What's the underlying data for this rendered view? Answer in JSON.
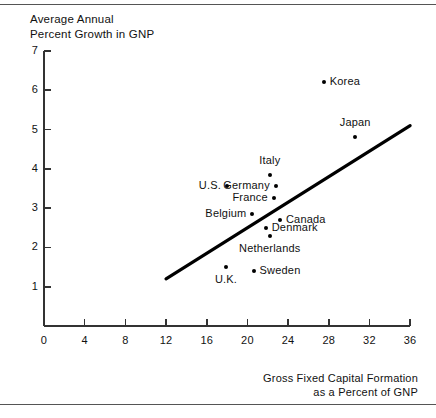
{
  "chart_data": {
    "type": "scatter",
    "title": "Average Annual\nPercent Growth in GNP",
    "ylabel": "Average Annual Percent Growth in GNP",
    "xlabel": "Gross Fixed Capital Formation\nas a Percent of GNP",
    "xlim": [
      0,
      36
    ],
    "ylim": [
      0,
      7
    ],
    "xticks": [
      0,
      4,
      8,
      12,
      16,
      20,
      24,
      28,
      32,
      36
    ],
    "yticks": [
      1,
      2,
      3,
      4,
      5,
      6,
      7
    ],
    "xtick_labels": [
      "0",
      "4",
      "8",
      "12",
      "16",
      "20",
      "24",
      "28",
      "32",
      "36"
    ],
    "ytick_labels": [
      "1",
      "2",
      "3",
      "4",
      "5",
      "6",
      "7"
    ],
    "grid": false,
    "legend": false,
    "points": [
      {
        "label": "Korea",
        "x": 27.5,
        "y": 6.2,
        "label_pos": "right"
      },
      {
        "label": "Japan",
        "x": 30.6,
        "y": 4.8,
        "label_pos": "above"
      },
      {
        "label": "Italy",
        "x": 22.2,
        "y": 3.85,
        "label_pos": "above"
      },
      {
        "label": "U.S.",
        "x": 18.0,
        "y": 3.55,
        "label_pos": "left"
      },
      {
        "label": "Germany",
        "x": 22.8,
        "y": 3.55,
        "label_pos": "left"
      },
      {
        "label": "France",
        "x": 22.6,
        "y": 3.25,
        "label_pos": "left"
      },
      {
        "label": "Belgium",
        "x": 20.5,
        "y": 2.85,
        "label_pos": "left"
      },
      {
        "label": "Canada",
        "x": 23.2,
        "y": 2.7,
        "label_pos": "right"
      },
      {
        "label": "Denmark",
        "x": 21.8,
        "y": 2.5,
        "label_pos": "right"
      },
      {
        "label": "Netherlands",
        "x": 22.2,
        "y": 2.3,
        "label_pos": "above"
      },
      {
        "label": "U.K.",
        "x": 17.9,
        "y": 1.5,
        "label_pos": "above"
      },
      {
        "label": "Sweden",
        "x": 20.6,
        "y": 1.4,
        "label_pos": "right"
      }
    ],
    "trend_line": {
      "x0": 12.0,
      "y0": 1.2,
      "x1": 36.0,
      "y1": 5.1
    },
    "colors": {
      "ink": "#000000",
      "axis": "#333333",
      "rule": "#555555"
    }
  }
}
